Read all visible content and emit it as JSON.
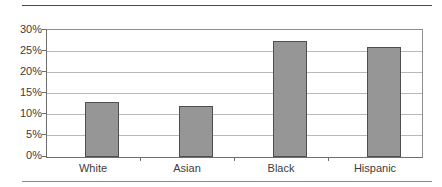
{
  "chart_data": {
    "type": "bar",
    "title": "",
    "subtitle": "",
    "xlabel": "",
    "ylabel": "",
    "categories": [
      "White",
      "Asian",
      "Black",
      "Hispanic"
    ],
    "values": [
      13,
      12,
      27.5,
      26
    ],
    "value_labels": [
      "13%",
      "12%",
      "27.5%",
      "26%"
    ],
    "ylim": [
      0,
      30
    ],
    "ytick_values": [
      0,
      5,
      10,
      15,
      20,
      25,
      30
    ],
    "ytick_labels": [
      "0%",
      "5%",
      "10%",
      "15%",
      "20%",
      "25%",
      "30%"
    ],
    "grid": true,
    "legend": false,
    "legend_position": "none",
    "series": [
      {
        "name": "",
        "values": [
          13,
          12,
          27.5,
          26
        ]
      }
    ],
    "colors": {
      "bar_fill": "#969696",
      "bar_border": "#4f4f4f",
      "gridline": "#b9b9b9",
      "axis": "#6e6e6e",
      "text": "#3c3c3c",
      "rule": "#4a4a4a",
      "background": "#ffffff"
    }
  }
}
